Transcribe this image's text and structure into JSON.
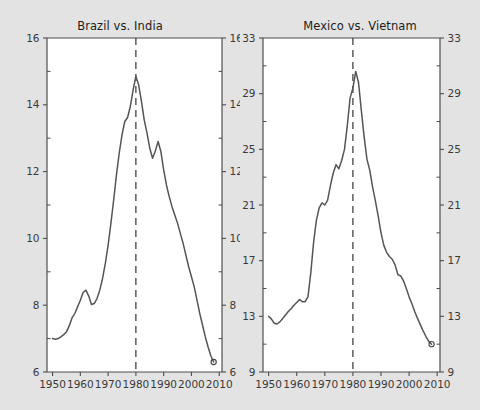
{
  "figure": {
    "background_color": "#e3e3e3",
    "plot_background_color": "#ffffff",
    "line_color": "#555555",
    "axis_color": "#4d4d4d",
    "text_color": "#3a3a3a"
  },
  "chart_data": [
    {
      "type": "line",
      "title": "Brazil vs. India",
      "xlabel": "",
      "ylabel": "",
      "xlim": [
        1948,
        2011
      ],
      "ylim": [
        6,
        16
      ],
      "grid": false,
      "legend": null,
      "x_ticks": [
        1950,
        1960,
        1970,
        1980,
        1990,
        2000,
        2010
      ],
      "y_ticks": [
        6,
        8,
        10,
        12,
        14,
        16
      ],
      "y_axis_right_mirrored": true,
      "annotations": [
        {
          "name": "reference-line",
          "type": "vline",
          "x": 1980,
          "style": "dashed"
        },
        {
          "name": "endpoint-marker",
          "type": "point",
          "x": 2008,
          "y": 6.3,
          "marker": "open-circle"
        }
      ],
      "series": [
        {
          "name": "Brazil vs. India ratio",
          "x": [
            1950,
            1951,
            1952,
            1953,
            1954,
            1955,
            1956,
            1957,
            1958,
            1959,
            1960,
            1961,
            1962,
            1963,
            1964,
            1965,
            1966,
            1967,
            1968,
            1969,
            1970,
            1971,
            1972,
            1973,
            1974,
            1975,
            1976,
            1977,
            1978,
            1979,
            1980,
            1981,
            1982,
            1983,
            1984,
            1985,
            1986,
            1987,
            1988,
            1989,
            1990,
            1991,
            1992,
            1993,
            1994,
            1995,
            1996,
            1997,
            1998,
            1999,
            2000,
            2001,
            2002,
            2003,
            2004,
            2005,
            2006,
            2007,
            2008
          ],
          "values": [
            7.0,
            6.98,
            7.0,
            7.05,
            7.12,
            7.2,
            7.38,
            7.62,
            7.75,
            7.95,
            8.15,
            8.38,
            8.45,
            8.28,
            8.02,
            8.05,
            8.2,
            8.45,
            8.8,
            9.25,
            9.8,
            10.45,
            11.15,
            11.9,
            12.55,
            13.1,
            13.5,
            13.62,
            13.95,
            14.45,
            14.85,
            14.6,
            14.1,
            13.55,
            13.15,
            12.7,
            12.4,
            12.62,
            12.9,
            12.6,
            12.05,
            11.6,
            11.25,
            10.95,
            10.7,
            10.45,
            10.15,
            9.85,
            9.5,
            9.15,
            8.85,
            8.55,
            8.15,
            7.75,
            7.4,
            7.05,
            6.75,
            6.48,
            6.3
          ]
        }
      ]
    },
    {
      "type": "line",
      "title": "Mexico vs. Vietnam",
      "xlabel": "",
      "ylabel": "",
      "xlim": [
        1948,
        2011
      ],
      "ylim": [
        9,
        33
      ],
      "grid": false,
      "legend": null,
      "x_ticks": [
        1950,
        1960,
        1970,
        1980,
        1990,
        2000,
        2010
      ],
      "y_ticks": [
        9,
        13,
        17,
        21,
        25,
        29,
        33
      ],
      "y_axis_right_mirrored": true,
      "annotations": [
        {
          "name": "reference-line",
          "type": "vline",
          "x": 1980,
          "style": "dashed"
        },
        {
          "name": "endpoint-marker",
          "type": "point",
          "x": 2008,
          "y": 11.0,
          "marker": "open-circle"
        }
      ],
      "series": [
        {
          "name": "Mexico vs. Vietnam ratio",
          "x": [
            1950,
            1951,
            1952,
            1953,
            1954,
            1955,
            1956,
            1957,
            1958,
            1959,
            1960,
            1961,
            1962,
            1963,
            1964,
            1965,
            1966,
            1967,
            1968,
            1969,
            1970,
            1971,
            1972,
            1973,
            1974,
            1975,
            1976,
            1977,
            1978,
            1979,
            1980,
            1981,
            1982,
            1983,
            1984,
            1985,
            1986,
            1987,
            1988,
            1989,
            1990,
            1991,
            1992,
            1993,
            1994,
            1995,
            1996,
            1997,
            1998,
            1999,
            2000,
            2001,
            2002,
            2003,
            2004,
            2005,
            2006,
            2007,
            2008
          ],
          "values": [
            13.0,
            12.8,
            12.5,
            12.45,
            12.6,
            12.85,
            13.1,
            13.35,
            13.55,
            13.8,
            14.0,
            14.2,
            14.05,
            14.05,
            14.4,
            16.1,
            18.3,
            19.9,
            20.8,
            21.15,
            21.0,
            21.35,
            22.4,
            23.3,
            23.9,
            23.6,
            24.2,
            25.0,
            26.7,
            28.7,
            29.4,
            30.6,
            29.8,
            27.8,
            25.9,
            24.3,
            23.5,
            22.3,
            21.3,
            20.2,
            19.0,
            18.1,
            17.6,
            17.3,
            17.1,
            16.7,
            16.0,
            15.9,
            15.55,
            15.0,
            14.4,
            13.9,
            13.35,
            12.85,
            12.4,
            11.95,
            11.55,
            11.2,
            11.0
          ]
        }
      ]
    }
  ]
}
